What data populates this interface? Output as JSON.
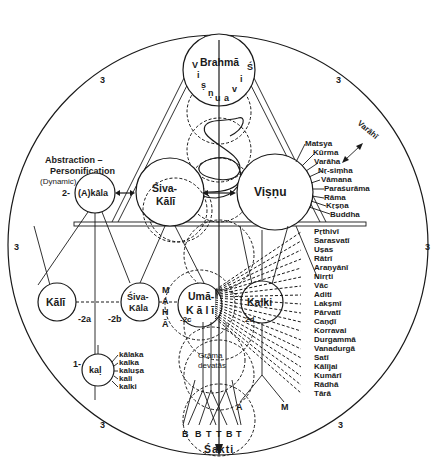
{
  "diagram": {
    "outer_circle_label": "3",
    "nodes": {
      "brahma": {
        "label": "Brahmā",
        "left_arc": [
          "V",
          "i",
          "ṣ"
        ],
        "bottom_arc": [
          "ṇ",
          "u",
          "a"
        ],
        "right_arc": [
          "Ś",
          "i",
          "v"
        ]
      },
      "akala": {
        "label": "(A)kāla",
        "prefix": "2-"
      },
      "siva_kali": {
        "line1": "Śiva-",
        "line2": "Kālī"
      },
      "visnu": {
        "label": "Viṣṇu"
      },
      "kali": {
        "label": "Kālī",
        "suffix": "-2a"
      },
      "siva_kala": {
        "line1": "Śiva-",
        "line2": "Kāla",
        "prefix": "-2b"
      },
      "uma_kali": {
        "line1": "Umā-",
        "line2": "Kālī",
        "prefix": "-2c"
      },
      "kalki": {
        "label": "Kalki",
        "prefix": "2d"
      },
      "kal": {
        "label": "kaḷ",
        "prefix": "1-"
      },
      "grama": {
        "line1": "Grāma",
        "line2": "devatās"
      },
      "sakti": {
        "label": "Śakti"
      }
    },
    "abstraction_label": {
      "line1": "Abstraction –",
      "line2": "Personification",
      "line3": "(Dynamic)"
    },
    "mahā_letters": [
      "M",
      "A",
      "H",
      "Ā"
    ],
    "varahi": "Varāhī",
    "avatars": [
      "Matsya",
      "Kūrma",
      "Varāha",
      "Nṛ-siṃha",
      "Vāmana",
      "Paraśurāma",
      "Rāma",
      "Kṛṣṇa",
      "Buddha"
    ],
    "goddesses": [
      "Pṛthivī",
      "Sarasvatī",
      "Uṣas",
      "Rātrī",
      "Araṇyānī",
      "Nirṛti",
      "Vāc",
      "Aditi",
      "Lakṣmī",
      "Pārvatī",
      "Caṇḍī",
      "Korravai",
      "Durgammā",
      "Vanadurgā",
      "Satī",
      "Kālījai",
      "Kumārī",
      "Rādhā",
      "Tārā"
    ],
    "kal_words": [
      "kālaka",
      "kalka",
      "kaluṣa",
      "kali",
      "kalki"
    ],
    "bottom_letters": [
      "B",
      "B",
      "T",
      "T",
      "B",
      "T"
    ],
    "kalki_legs": [
      "A",
      "M"
    ],
    "region_numbers": [
      "3",
      "3",
      "3",
      "3",
      "3",
      "3"
    ]
  }
}
